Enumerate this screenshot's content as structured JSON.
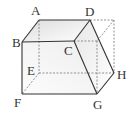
{
  "diagram": {
    "type": "solid-figure",
    "vertices": {
      "A": {
        "label": "A",
        "x": 39,
        "y": 20
      },
      "B": {
        "label": "B",
        "x": 22,
        "y": 42
      },
      "C": {
        "label": "C",
        "x": 74,
        "y": 41
      },
      "D": {
        "label": "D",
        "x": 90,
        "y": 20
      },
      "E": {
        "label": "E",
        "x": 39,
        "y": 73
      },
      "F": {
        "label": "F",
        "x": 22,
        "y": 94
      },
      "G": {
        "label": "G",
        "x": 97,
        "y": 94
      },
      "H": {
        "label": "H",
        "x": 114,
        "y": 73
      }
    },
    "labels": [
      {
        "id": "A",
        "text": "A",
        "x": 31,
        "y": 15
      },
      {
        "id": "B",
        "text": "B",
        "x": 12,
        "y": 47
      },
      {
        "id": "C",
        "text": "C",
        "x": 64,
        "y": 55
      },
      {
        "id": "D",
        "text": "D",
        "x": 85,
        "y": 16
      },
      {
        "id": "E",
        "text": "E",
        "x": 27,
        "y": 75
      },
      {
        "id": "F",
        "text": "F",
        "x": 14,
        "y": 107
      },
      {
        "id": "G",
        "text": "G",
        "x": 93,
        "y": 109
      },
      {
        "id": "H",
        "text": "H",
        "x": 117,
        "y": 79
      }
    ],
    "colors": {
      "edge": "#333333",
      "hidden_edge": "#666666",
      "shade": "#e6e6e6"
    }
  }
}
